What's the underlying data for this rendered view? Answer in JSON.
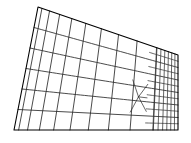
{
  "figure": {
    "name": "finite-element-mesh",
    "background_color": "#ffffff",
    "line_color": "#1a1a1a",
    "boundary_color": "#000000"
  },
  "chart_data": {
    "type": "mesh",
    "title": "",
    "xlabel": "",
    "ylabel": "",
    "grid": false,
    "legend": null,
    "domain_shape": "wedge",
    "boundary_points": [
      [
        38,
        7
      ],
      [
        178,
        55
      ],
      [
        178,
        130
      ],
      [
        14,
        130
      ]
    ],
    "left_edge_divisions": 6,
    "bottom_edge_divisions": 10,
    "right_edge_divisions": 12,
    "coarse_columns": 10,
    "refined_columns": 6,
    "refinement_direction": "right",
    "transition_zone": {
      "x_start": 140,
      "x_end": 178,
      "y_start": 80,
      "y_end": 118,
      "type": "quad-transition"
    }
  }
}
